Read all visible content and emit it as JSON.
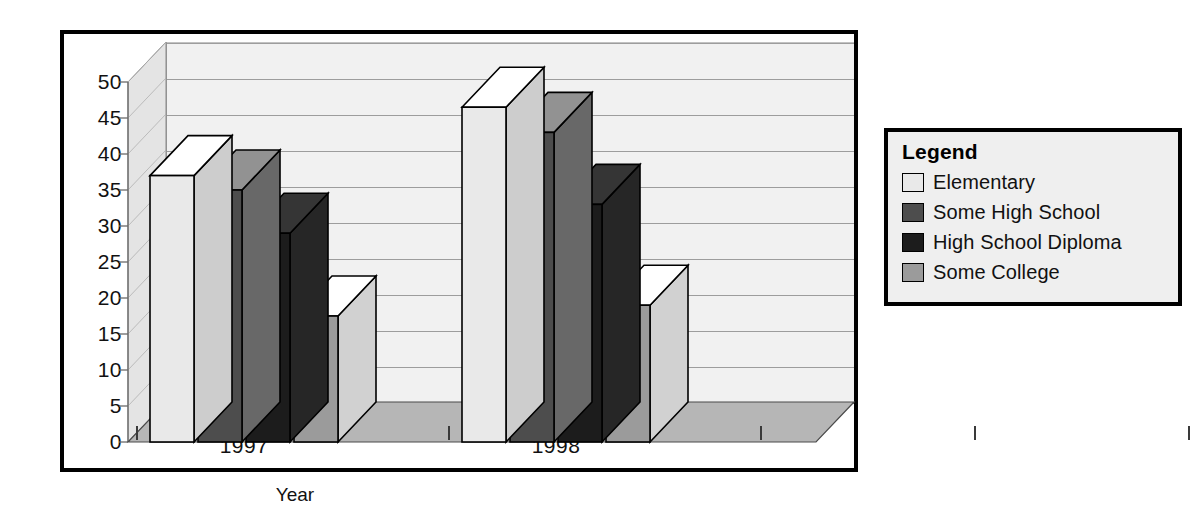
{
  "chart_data": {
    "type": "bar",
    "title": "",
    "subtitle": "",
    "xlabel": "Year",
    "ylabel": "Percent Difference",
    "categories": [
      "1997",
      "1998"
    ],
    "series": [
      {
        "name": "Elementary",
        "color": "#e9e9e9",
        "values": [
          37,
          46.5
        ]
      },
      {
        "name": "Some High School",
        "color": "#4d4d4d",
        "values": [
          35,
          43
        ]
      },
      {
        "name": "High School Diploma",
        "color": "#1c1c1c",
        "values": [
          29,
          33
        ]
      },
      {
        "name": "Some College",
        "color": "#9b9b9b",
        "values": [
          17.5,
          19
        ]
      }
    ],
    "ylim": [
      0,
      50
    ],
    "ytick_step": 5,
    "ytick_labels": [
      "0",
      "5",
      "10",
      "15",
      "20",
      "25",
      "30",
      "35",
      "40",
      "45",
      "50"
    ],
    "grid": true,
    "grid_axis": "y",
    "legend_position": "right-outside",
    "style": "3d-column",
    "annotations": []
  },
  "legend": {
    "title": "Legend",
    "entries": [
      {
        "label": "Elementary",
        "color": "#e9e9e9"
      },
      {
        "label": "Some High School",
        "color": "#4d4d4d"
      },
      {
        "label": "High School Diploma",
        "color": "#1c1c1c"
      },
      {
        "label": "Some College",
        "color": "#9b9b9b"
      }
    ]
  },
  "colors": {
    "frame_border": "#000000",
    "back_wall": "#f1f1f1",
    "floor": "#b6b6b6",
    "left_wall": "#e4e4e4",
    "gridline": "#9d9d9d",
    "text": "#111111",
    "legend_background": "#efefef"
  }
}
